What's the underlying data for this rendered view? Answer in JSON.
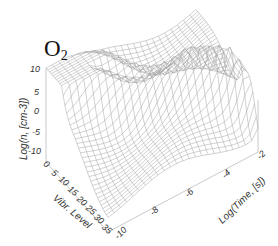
{
  "chart_data": {
    "type": "surface3d",
    "title": "O2",
    "title_main": "O",
    "title_sub": "2",
    "xlabel": "Vibr. Level",
    "ylabel": "Log(Time, [s])",
    "zlabel": "Log(n, [cm-3])",
    "x_ticks": [
      "0",
      "5",
      "10",
      "15",
      "20",
      "25",
      "30",
      "35"
    ],
    "y_ticks": [
      "-10",
      "-8",
      "-6",
      "-4",
      "-2"
    ],
    "z_ticks": [
      "10",
      "5",
      "0",
      "-5",
      "-10"
    ],
    "xlim": [
      0,
      35
    ],
    "ylim": [
      -10,
      -2
    ],
    "zlim": [
      -10,
      10
    ],
    "grid": false,
    "legend": null,
    "style": "wireframe mesh, light gray lines"
  }
}
